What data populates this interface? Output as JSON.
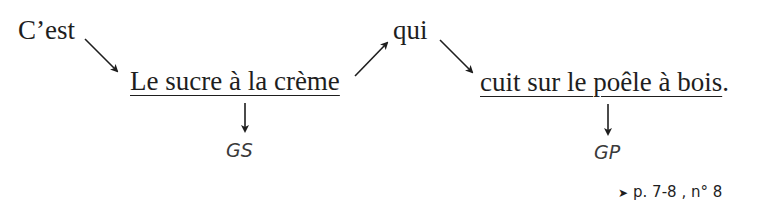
{
  "sentence": {
    "intro": "C’est",
    "subject_group": "Le sucre à la crème",
    "relative": "qui",
    "predicate_group": "cuit sur le poêle à bois",
    "final_punct": "."
  },
  "labels": {
    "subject_abbrev": "GS",
    "predicate_abbrev": "GP"
  },
  "reference": {
    "marker_icon": "arrowhead-right-icon",
    "marker": "➤",
    "text": "p. 7-8 , n° 8"
  },
  "colors": {
    "text": "#1e1e1e",
    "label": "#3a3a3a",
    "arrow": "#1e1e1e"
  }
}
